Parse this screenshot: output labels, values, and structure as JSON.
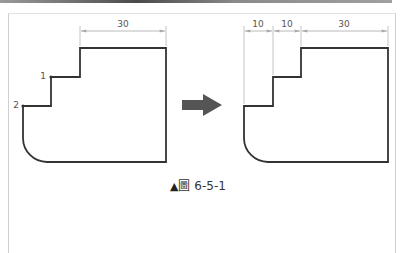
{
  "figure": {
    "caption": {
      "marker": "▲",
      "prefix": "圖",
      "number": "6-5-1"
    },
    "left_drawing": {
      "dimension_label": "30",
      "point_labels": [
        "1",
        "2"
      ]
    },
    "right_drawing": {
      "dimension_labels": [
        "10",
        "10",
        "30"
      ]
    },
    "arrow": {
      "direction": "right",
      "color": "#555555"
    },
    "colors": {
      "outline": "#333333",
      "dimension_line": "#a8a8a8",
      "frame_border": "#cfcfcf"
    }
  }
}
